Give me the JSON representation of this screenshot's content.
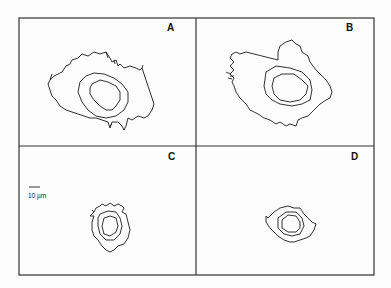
{
  "figure": {
    "panels": [
      {
        "id": "A",
        "label": "A"
      },
      {
        "id": "B",
        "label": "B"
      },
      {
        "id": "C",
        "label": "C"
      },
      {
        "id": "D",
        "label": "D"
      }
    ],
    "scale_bar": {
      "label": "10 µm"
    },
    "colors": {
      "line": "#1a1a1a",
      "frame": "#333333",
      "background": "#fdfdfd"
    }
  }
}
